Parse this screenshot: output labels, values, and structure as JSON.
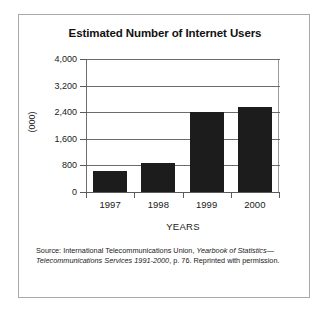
{
  "figure": {
    "title": "Estimated Number of Internet Users",
    "source_note": {
      "prefix": "Source: International Telecommunications Union,",
      "italic_1": "Yearbook of Statistics",
      "middle": "—",
      "italic_2": "Telecommunications Services 1991-2000",
      "suffix": ", p. 76. Reprinted with permission."
    }
  },
  "chart_data": {
    "type": "bar",
    "title": "Estimated Number of Internet Users",
    "xlabel": "YEARS",
    "ylabel": "(000)",
    "categories": [
      "1997",
      "1998",
      "1999",
      "2000"
    ],
    "values": [
      620,
      880,
      2400,
      2550
    ],
    "ylim": [
      0,
      4000
    ],
    "yticks": [
      0,
      800,
      1600,
      2400,
      3200,
      4000
    ],
    "ytick_labels": [
      "0",
      "800",
      "1,600",
      "2,400",
      "3,200",
      "4,000"
    ],
    "grid": true,
    "legend": null,
    "bar_color": "#1c1c1c",
    "series": [
      {
        "name": "Estimated Number of Internet Users",
        "values": [
          620,
          880,
          2400,
          2550
        ]
      }
    ]
  }
}
